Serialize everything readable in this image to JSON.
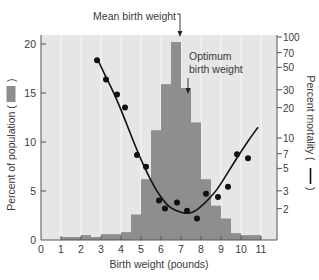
{
  "chart_data": {
    "type": "bar",
    "title": "",
    "xlabel": "Birth weight (pounds)",
    "ylabel": "Percent of population (■)",
    "ylabel_text": "Percent of population (",
    "ylabel_close": ")",
    "y2label": "Percent mortality (",
    "y2label_close": ")",
    "xlim": [
      0,
      11.25
    ],
    "ylim": [
      0,
      21
    ],
    "x_ticks": [
      0,
      1,
      2,
      3,
      4,
      5,
      6,
      7,
      8,
      9,
      10,
      11
    ],
    "y_ticks": [
      0,
      5,
      10,
      15,
      20
    ],
    "y2_scale": "log",
    "y2_ticks": [
      2,
      3,
      5,
      7,
      10,
      20,
      30,
      50,
      70,
      100
    ],
    "y2lim": [
      1,
      130
    ],
    "grid": "vertical lines at integer x",
    "series": [
      {
        "name": "Percent of population",
        "type": "histogram",
        "color": "#8e8e8e",
        "bins": [
          {
            "from": 1.0,
            "to": 2.0,
            "value": 0.3
          },
          {
            "from": 2.0,
            "to": 2.5,
            "value": 0.5
          },
          {
            "from": 2.5,
            "to": 3.0,
            "value": 0.3
          },
          {
            "from": 3.0,
            "to": 4.0,
            "value": 0.6
          },
          {
            "from": 4.0,
            "to": 4.5,
            "value": 0.8
          },
          {
            "from": 4.5,
            "to": 5.0,
            "value": 2.6
          },
          {
            "from": 5.0,
            "to": 5.5,
            "value": 6.2
          },
          {
            "from": 5.5,
            "to": 6.0,
            "value": 11.2
          },
          {
            "from": 6.0,
            "to": 6.5,
            "value": 15.9
          },
          {
            "from": 6.5,
            "to": 7.0,
            "value": 20.2
          },
          {
            "from": 7.0,
            "to": 7.5,
            "value": 15.5
          },
          {
            "from": 7.5,
            "to": 8.0,
            "value": 12.0
          },
          {
            "from": 8.0,
            "to": 8.5,
            "value": 6.2
          },
          {
            "from": 8.5,
            "to": 9.0,
            "value": 3.5
          },
          {
            "from": 9.0,
            "to": 9.5,
            "value": 2.2
          },
          {
            "from": 9.5,
            "to": 10.0,
            "value": 0.7
          },
          {
            "from": 10.0,
            "to": 11.0,
            "value": 0.5
          }
        ]
      },
      {
        "name": "Percent mortality (observed)",
        "type": "scatter",
        "axis": "y2",
        "color": "#111111",
        "points": [
          [
            2.8,
            59
          ],
          [
            3.25,
            38
          ],
          [
            3.8,
            27
          ],
          [
            4.2,
            20
          ],
          [
            4.8,
            6.8
          ],
          [
            5.25,
            5.2
          ],
          [
            5.9,
            2.4
          ],
          [
            6.2,
            2.0
          ],
          [
            6.8,
            2.3
          ],
          [
            7.3,
            1.9
          ],
          [
            7.8,
            1.6
          ],
          [
            8.25,
            2.8
          ],
          [
            8.85,
            2.6
          ],
          [
            9.35,
            3.3
          ],
          [
            9.8,
            6.9
          ],
          [
            10.35,
            6.3
          ]
        ]
      },
      {
        "name": "Percent mortality (fitted curve)",
        "type": "line",
        "axis": "y2",
        "color": "#111111",
        "points": [
          [
            2.8,
            62
          ],
          [
            3.2,
            42
          ],
          [
            3.6,
            29
          ],
          [
            4.0,
            19
          ],
          [
            4.4,
            12
          ],
          [
            4.8,
            7.6
          ],
          [
            5.2,
            5.0
          ],
          [
            5.6,
            3.5
          ],
          [
            6.0,
            2.6
          ],
          [
            6.4,
            2.1
          ],
          [
            6.8,
            1.9
          ],
          [
            7.2,
            1.8
          ],
          [
            7.6,
            1.85
          ],
          [
            8.0,
            2.1
          ],
          [
            8.4,
            2.5
          ],
          [
            8.8,
            3.1
          ],
          [
            9.2,
            4.1
          ],
          [
            9.6,
            5.5
          ],
          [
            10.0,
            7.3
          ],
          [
            10.4,
            9.6
          ],
          [
            10.85,
            12.8
          ]
        ]
      }
    ],
    "annotations": [
      {
        "text": "Mean birth weight",
        "x": 6.95,
        "arrow": "down"
      },
      {
        "text_lines": [
          "Optimum",
          "birth weight"
        ],
        "x": 7.35,
        "arrow": "down"
      }
    ]
  },
  "colors": {
    "plot_background": "#e6e6e6",
    "gridline": "#f6f6f6",
    "bar": "#8e8e8e",
    "axis": "#555555",
    "text": "#3a3a3a",
    "line": "#111111"
  }
}
